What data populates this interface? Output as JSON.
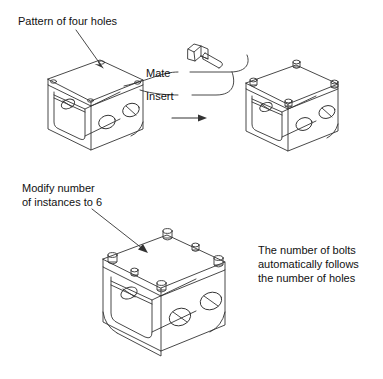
{
  "figure": {
    "type": "technical-line-illustration",
    "background_color": "#ffffff",
    "line_color": "#333333",
    "text_color": "#111111",
    "width": 383,
    "height": 379
  },
  "annotations": {
    "pattern_label": "Pattern of four holes",
    "mate_label": "Mate",
    "insert_label": "Insert",
    "modify_label": "Modify number\nof instances to 6",
    "note_label": "The number of bolts\nautomatically follows\nthe number of holes"
  },
  "objects": {
    "bracket_left": {
      "name": "bracket-with-four-holes",
      "hole_count": 4,
      "bolt_count": 0
    },
    "bolt": {
      "name": "hex-head-bolt",
      "count": 1
    },
    "bracket_right": {
      "name": "bracket-with-four-bolts",
      "hole_count": 4,
      "bolt_count": 4
    },
    "bracket_bottom": {
      "name": "bracket-with-six-bolts",
      "hole_count": 6,
      "bolt_count": 6
    },
    "transform_arrow": {
      "name": "assembly-arrow",
      "direction": "right"
    }
  }
}
